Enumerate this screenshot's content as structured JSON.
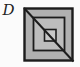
{
  "figure": {
    "label": "D",
    "canvas": {
      "width": 80,
      "height": 67
    },
    "colors": {
      "background": "#fbfbfb",
      "line": "#1c1c1c",
      "outer_fill": "#b0b0b0",
      "middle_fill": "#bdbdbd",
      "inner_fill": "#c7c7c7"
    },
    "label_pos": {
      "x": 2.5,
      "y": 15,
      "size": 15
    },
    "squares": [
      {
        "name": "outer",
        "x": 24.5,
        "y": 8.5,
        "w": 48,
        "h": 52,
        "sw": 2.4
      },
      {
        "name": "middle",
        "x": 33.5,
        "y": 17.5,
        "w": 31,
        "h": 33,
        "sw": 1.8
      },
      {
        "name": "inner",
        "x": 44.5,
        "y": 29.5,
        "w": 11.5,
        "h": 11.5,
        "sw": 1.6
      }
    ],
    "diagonal": {
      "x1": 24,
      "y1": 8,
      "x2": 73.5,
      "y2": 61.5,
      "sw": 2
    }
  }
}
